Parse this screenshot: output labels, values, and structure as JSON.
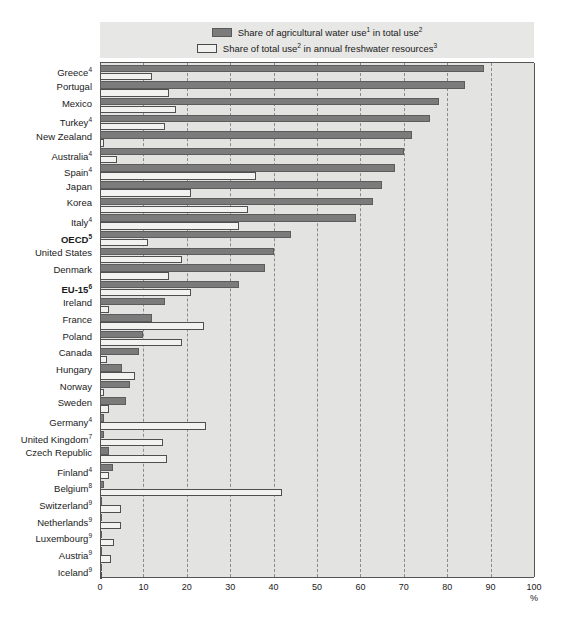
{
  "legend": {
    "series": [
      {
        "key": "agricultural",
        "label_html": "Share of agricultural water use<sup>1</sup> in total use<sup>2</sup>",
        "label": "Share of agricultural water use1 in total use2",
        "swatch": "dark",
        "color": "#7b7b7b"
      },
      {
        "key": "total_use",
        "label_html": "Share of total use<sup>2</sup> in annual freshwater resources<sup>3</sup>",
        "label": "Share of total use2 in annual freshwater resources3",
        "swatch": "light",
        "color": "#f2f2f0"
      }
    ]
  },
  "axis": {
    "unit": "%",
    "ticks": [
      "0",
      "10",
      "20",
      "30",
      "40",
      "50",
      "60",
      "70",
      "80",
      "90",
      "100"
    ],
    "min": 0,
    "max": 100,
    "step": 10
  },
  "chart_data": {
    "type": "bar",
    "orientation": "horizontal",
    "title": "",
    "xlabel": "%",
    "ylabel": "",
    "xlim": [
      0,
      100
    ],
    "grid": true,
    "legend_position": "top",
    "categories": [
      "Greece4",
      "Portugal",
      "Mexico",
      "Turkey4",
      "New Zealand",
      "Australia4",
      "Spain4",
      "Japan",
      "Korea",
      "Italy4",
      "OECD5",
      "United States",
      "Denmark",
      "EU-156",
      "Ireland",
      "France",
      "Poland",
      "Canada",
      "Hungary",
      "Norway",
      "Sweden",
      "Germany4",
      "United Kingdom7",
      "Czech Republic",
      "Finland4",
      "Belgium8",
      "Switzerland9",
      "Netherlands9",
      "Luxembourg9",
      "Austria9",
      "Iceland9"
    ],
    "series": [
      {
        "name": "Share of agricultural water use in total use",
        "values": [
          88.5,
          84,
          78,
          76,
          72,
          70,
          68,
          65,
          63,
          59,
          44,
          40,
          38,
          32,
          15,
          12,
          10,
          9,
          5,
          7,
          6,
          1,
          1,
          2,
          3,
          1,
          0.3,
          0.3,
          0.3,
          0.3,
          0.2
        ]
      },
      {
        "name": "Share of total use in annual freshwater resources",
        "values": [
          12,
          16,
          17.5,
          15,
          1,
          4,
          36,
          21,
          34,
          32,
          11,
          19,
          16,
          21,
          2,
          24,
          19,
          1.5,
          8,
          1,
          2,
          24.5,
          14.5,
          15.5,
          2,
          42,
          4.8,
          4.8,
          3.3,
          2.5,
          0.2
        ]
      }
    ]
  },
  "rows": [
    {
      "label_html": "Greece<sup>4</sup>",
      "label": "Greece4",
      "bold": false,
      "dark": 88.5,
      "light": 12
    },
    {
      "label_html": "Portugal",
      "label": "Portugal",
      "bold": false,
      "dark": 84,
      "light": 16
    },
    {
      "label_html": "Mexico",
      "label": "Mexico",
      "bold": false,
      "dark": 78,
      "light": 17.5
    },
    {
      "label_html": "Turkey<sup>4</sup>",
      "label": "Turkey4",
      "bold": false,
      "dark": 76,
      "light": 15
    },
    {
      "label_html": "New Zealand",
      "label": "New Zealand",
      "bold": false,
      "dark": 72,
      "light": 1
    },
    {
      "label_html": "Australia<sup>4</sup>",
      "label": "Australia4",
      "bold": false,
      "dark": 70,
      "light": 4
    },
    {
      "label_html": "Spain<sup>4</sup>",
      "label": "Spain4",
      "bold": false,
      "dark": 68,
      "light": 36
    },
    {
      "label_html": "Japan",
      "label": "Japan",
      "bold": false,
      "dark": 65,
      "light": 21
    },
    {
      "label_html": "Korea",
      "label": "Korea",
      "bold": false,
      "dark": 63,
      "light": 34
    },
    {
      "label_html": "Italy<sup>4</sup>",
      "label": "Italy4",
      "bold": false,
      "dark": 59,
      "light": 32
    },
    {
      "label_html": "OECD<sup>5</sup>",
      "label": "OECD5",
      "bold": true,
      "dark": 44,
      "light": 11
    },
    {
      "label_html": "United States",
      "label": "United States",
      "bold": false,
      "dark": 40,
      "light": 19
    },
    {
      "label_html": "Denmark",
      "label": "Denmark",
      "bold": false,
      "dark": 38,
      "light": 16
    },
    {
      "label_html": "EU-15<sup>6</sup>",
      "label": "EU-156",
      "bold": true,
      "dark": 32,
      "light": 21
    },
    {
      "label_html": "Ireland",
      "label": "Ireland",
      "bold": false,
      "dark": 15,
      "light": 2
    },
    {
      "label_html": "France",
      "label": "France",
      "bold": false,
      "dark": 12,
      "light": 24
    },
    {
      "label_html": "Poland",
      "label": "Poland",
      "bold": false,
      "dark": 10,
      "light": 19
    },
    {
      "label_html": "Canada",
      "label": "Canada",
      "bold": false,
      "dark": 9,
      "light": 1.5
    },
    {
      "label_html": "Hungary",
      "label": "Hungary",
      "bold": false,
      "dark": 5,
      "light": 8
    },
    {
      "label_html": "Norway",
      "label": "Norway",
      "bold": false,
      "dark": 7,
      "light": 1
    },
    {
      "label_html": "Sweden",
      "label": "Sweden",
      "bold": false,
      "dark": 6,
      "light": 2
    },
    {
      "label_html": "Germany<sup>4</sup>",
      "label": "Germany4",
      "bold": false,
      "dark": 1,
      "light": 24.5
    },
    {
      "label_html": "United Kingdom<sup>7</sup>",
      "label": "United Kingdom7",
      "bold": false,
      "dark": 1,
      "light": 14.5
    },
    {
      "label_html": "Czech Republic",
      "label": "Czech Republic",
      "bold": false,
      "dark": 2,
      "light": 15.5
    },
    {
      "label_html": "Finland<sup>4</sup>",
      "label": "Finland4",
      "bold": false,
      "dark": 3,
      "light": 2
    },
    {
      "label_html": "Belgium<sup>8</sup>",
      "label": "Belgium8",
      "bold": false,
      "dark": 1,
      "light": 42
    },
    {
      "label_html": "Switzerland<sup>9</sup>",
      "label": "Switzerland9",
      "bold": false,
      "dark": 0.3,
      "light": 4.8
    },
    {
      "label_html": "Netherlands<sup>9</sup>",
      "label": "Netherlands9",
      "bold": false,
      "dark": 0.3,
      "light": 4.8
    },
    {
      "label_html": "Luxembourg<sup>9</sup>",
      "label": "Luxembourg9",
      "bold": false,
      "dark": 0.3,
      "light": 3.3
    },
    {
      "label_html": "Austria<sup>9</sup>",
      "label": "Austria9",
      "bold": false,
      "dark": 0.3,
      "light": 2.5
    },
    {
      "label_html": "Iceland<sup>9</sup>",
      "label": "Iceland9",
      "bold": false,
      "dark": 0.2,
      "light": 0.2
    }
  ],
  "colors": {
    "dark_bar": "#7b7b7b",
    "light_bar": "#f2f2f0",
    "plot_background": "#e3e3e1",
    "legend_background": "#e7e7e5",
    "gridline": "#8a8a8a",
    "axis": "#555555"
  }
}
